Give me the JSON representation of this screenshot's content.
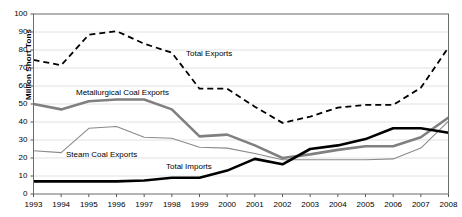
{
  "chart_data": {
    "type": "line",
    "title": "",
    "xlabel": "",
    "ylabel": "Million Short Tons",
    "ylim": [
      0,
      100
    ],
    "yticks": [
      0,
      10,
      20,
      30,
      40,
      50,
      60,
      70,
      80,
      90,
      100
    ],
    "grid": true,
    "legend_position": "inline-annotations",
    "categories": [
      "1993",
      "1994",
      "1995",
      "1996",
      "1997",
      "1998",
      "1999",
      "2000",
      "2001",
      "2002",
      "2003",
      "2004",
      "2005",
      "2006",
      "2007",
      "2008"
    ],
    "series": [
      {
        "name": "Total Exports",
        "style": "dashed",
        "color": "#000000",
        "width": 1.8,
        "values": [
          74.5,
          71.5,
          88.5,
          90.5,
          83.5,
          78.5,
          58.5,
          58.5,
          48.5,
          39.5,
          43.0,
          48.0,
          49.5,
          49.5,
          59.0,
          81.5
        ]
      },
      {
        "name": "Metallurgical Coal Exports",
        "style": "solid",
        "color": "#808080",
        "width": 2.6,
        "values": [
          50.0,
          47.0,
          51.5,
          52.5,
          52.5,
          47.0,
          32.0,
          33.0,
          27.0,
          20.0,
          22.0,
          24.5,
          26.5,
          26.5,
          31.5,
          42.5
        ]
      },
      {
        "name": "Steam Coal Exports",
        "style": "solid",
        "color": "#8a8a8a",
        "width": 1.1,
        "values": [
          24.0,
          23.0,
          36.5,
          37.5,
          31.5,
          31.0,
          26.0,
          25.5,
          22.5,
          19.0,
          19.0,
          19.0,
          19.0,
          19.5,
          25.5,
          40.5
        ]
      },
      {
        "name": "Total Imports",
        "style": "solid",
        "color": "#000000",
        "width": 2.6,
        "values": [
          7.0,
          7.0,
          7.0,
          7.0,
          7.5,
          9.0,
          9.0,
          13.0,
          19.5,
          16.5,
          25.0,
          27.0,
          30.5,
          36.5,
          36.5,
          34.0
        ]
      }
    ],
    "annotations": [
      {
        "text": "Total Exports",
        "x": 186,
        "y": 49
      },
      {
        "text": "Metallurgical Coal Exports",
        "x": 76,
        "y": 88
      },
      {
        "text": "Steam Coal Exports",
        "x": 66,
        "y": 150
      },
      {
        "text": "Total Imports",
        "x": 166,
        "y": 162
      }
    ]
  }
}
